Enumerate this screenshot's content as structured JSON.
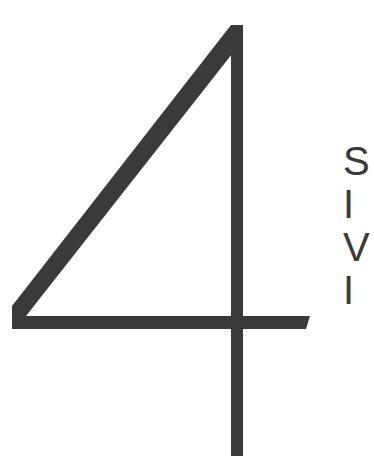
{
  "numeral": {
    "text": "4",
    "color": "#3a3a3a"
  },
  "side_text": {
    "lines": [
      "S",
      "I",
      "V",
      "I"
    ]
  }
}
